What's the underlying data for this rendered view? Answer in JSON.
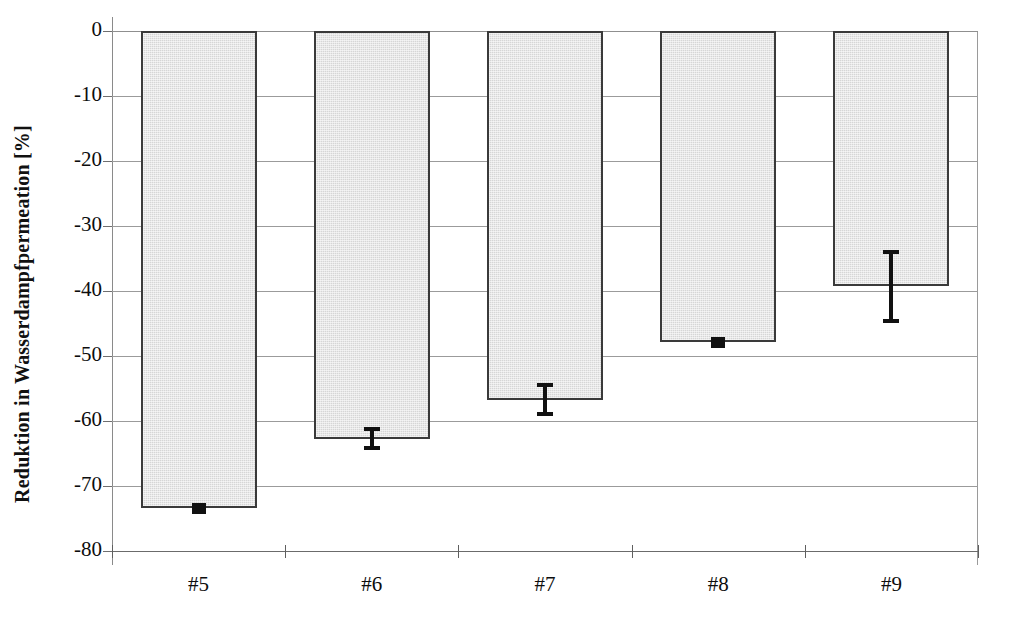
{
  "chart_data": {
    "type": "bar",
    "title": "",
    "subtitle": "",
    "xlabel": "",
    "ylabel": "Reduktion in Wasserdampfpermeation [%]",
    "categories": [
      "#5",
      "#6",
      "#7",
      "#8",
      "#9"
    ],
    "values": [
      -73.4,
      -62.7,
      -56.7,
      -47.9,
      -39.3
    ],
    "errors": [
      0.4,
      1.8,
      2.6,
      0.4,
      5.6
    ],
    "series": [
      {
        "name": "Reduktion in Wasserdampfpermeation",
        "values": [
          -73.4,
          -62.7,
          -56.7,
          -47.9,
          -39.3
        ],
        "errors": [
          0.4,
          1.8,
          2.6,
          0.4,
          5.6
        ]
      }
    ],
    "ylim": [
      -80,
      0
    ],
    "xlim_categories": 5,
    "yticks": [
      0,
      -10,
      -20,
      -30,
      -40,
      -50,
      -60,
      -70,
      -80
    ],
    "ytick_labels": [
      "0",
      "-10",
      "-20",
      "-30",
      "-40",
      "-50",
      "-60",
      "-70",
      "-80"
    ],
    "grid": true,
    "grid_axis": "y",
    "legend": "none",
    "bar_fill_color": "#d6d6d6",
    "bar_edge_color": "#3a3a3a",
    "error_bar_color": "#111111",
    "axis_color": "#6f6f6f",
    "gridline_color": "#9b9b9b",
    "background_color": "#ffffff",
    "text_color": "#0d0d0d"
  },
  "axes": {
    "y_title": "Reduktion in Wasserdampfpermeation [%]",
    "y_ticks": [
      {
        "label": "0",
        "value": 0
      },
      {
        "label": "-10",
        "value": -10
      },
      {
        "label": "-20",
        "value": -20
      },
      {
        "label": "-30",
        "value": -30
      },
      {
        "label": "-40",
        "value": -40
      },
      {
        "label": "-50",
        "value": -50
      },
      {
        "label": "-60",
        "value": -60
      },
      {
        "label": "-70",
        "value": -70
      },
      {
        "label": "-80",
        "value": -80
      }
    ],
    "x_ticks": [
      {
        "label": "#5"
      },
      {
        "label": "#6"
      },
      {
        "label": "#7"
      },
      {
        "label": "#8"
      },
      {
        "label": "#9"
      }
    ]
  },
  "bars": [
    {
      "category": "#5",
      "value": -73.4,
      "error": 0.4
    },
    {
      "category": "#6",
      "value": -62.7,
      "error": 1.8
    },
    {
      "category": "#7",
      "value": -56.7,
      "error": 2.6
    },
    {
      "category": "#8",
      "value": -47.9,
      "error": 0.4
    },
    {
      "category": "#9",
      "value": -39.3,
      "error": 5.6
    }
  ]
}
